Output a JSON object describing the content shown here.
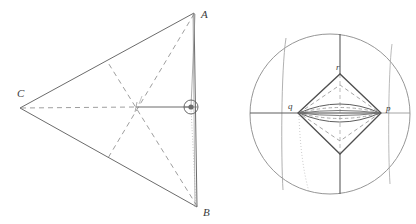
{
  "figure": {
    "background_color": "#ffffff",
    "stroke_color": "#555555",
    "light_stroke_color": "#8a8a8a",
    "dash_color": "#777777",
    "label_color": "#3a3a3a",
    "left_panel": {
      "name": "triangle-diagram",
      "vertices": [
        {
          "label": "A",
          "x": 194,
          "y": 13,
          "label_x": 201,
          "label_y": 17
        },
        {
          "label": "B",
          "x": 197,
          "y": 207,
          "label_x": 203,
          "label_y": 213
        },
        {
          "label": "C",
          "x": 20,
          "y": 108,
          "label_x": 20,
          "label_y": 96
        }
      ],
      "marker": {
        "name": "node-circle",
        "cx": 191,
        "cy": 107,
        "r": 7
      },
      "solid_edges": [
        {
          "from": "C",
          "to": "A"
        },
        {
          "from": "C",
          "to": "B"
        },
        {
          "from": "A",
          "to": "B"
        }
      ],
      "dashed_edges": [
        {
          "from": "C",
          "to": "marker",
          "note": "horizontal median, dashed"
        },
        {
          "from": "A",
          "to": "midpoint-CB"
        },
        {
          "from": "B",
          "to": "midpoint-CA"
        }
      ]
    },
    "right_panel": {
      "name": "circle-diagram",
      "circle": {
        "cx": 330,
        "cy": 114,
        "r": 80
      },
      "vertices": [
        {
          "label": "q",
          "x": 298,
          "y": 113,
          "label_x": 292,
          "label_y": 108
        },
        {
          "label": "p",
          "x": 381,
          "y": 113,
          "label_x": 387,
          "label_y": 109
        },
        {
          "label": "r",
          "x": 340,
          "y": 74,
          "label_x": 337,
          "label_y": 66
        }
      ],
      "bottom_apex": {
        "x": 340,
        "y": 154
      },
      "meridians": [
        {
          "name": "meridian-left",
          "x_top": 285,
          "x_bottom": 281
        },
        {
          "name": "meridian-center",
          "x_top": 340,
          "x_bottom": 340
        },
        {
          "name": "meridian-right",
          "x_top": 392,
          "x_bottom": 389
        }
      ],
      "equator": {
        "name": "equator-line",
        "y": 113
      },
      "lens_count": 3
    }
  }
}
